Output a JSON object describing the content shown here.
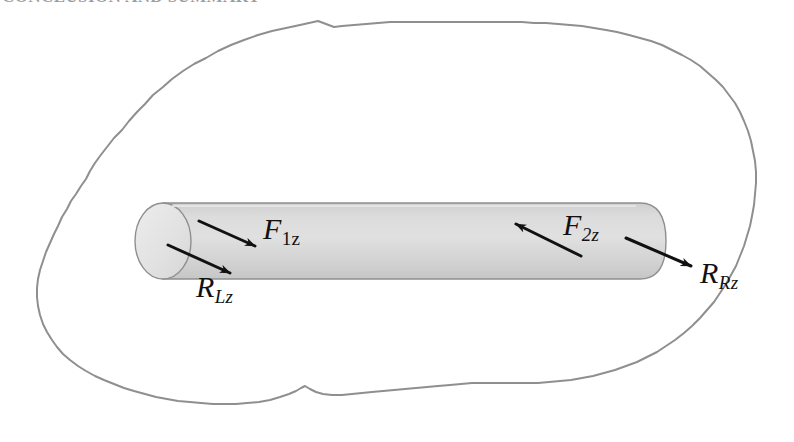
{
  "page": {
    "header_text": "CONCLUSION AND SUMMARY",
    "background_color": "#ffffff"
  },
  "figure": {
    "name": "free-body-diagram-cylinder",
    "boundary": {
      "name": "cut-boundary-blob",
      "stroke_color": "#8f8f8f",
      "fill_color": "#ffffff",
      "stroke_width": 2
    },
    "cylinder": {
      "name": "cylinder-bar",
      "body_fill": "#d7d7d7",
      "cap_fill": "#e6e6e6",
      "stroke_color": "#8f8f8f",
      "stroke_width": 1.4,
      "left_x": 136,
      "right_x": 666,
      "top_y": 203,
      "bottom_y": 279
    },
    "arrows": [
      {
        "name": "force-arrow-F1z",
        "label": "F",
        "subscript": "1z",
        "color": "#111111",
        "direction": "down-right",
        "from": [
          199,
          221
        ],
        "to": [
          261,
          249
        ]
      },
      {
        "name": "reaction-arrow-RLz",
        "label": "R",
        "subscript": "Lz",
        "color": "#111111",
        "direction": "down-right",
        "from": [
          168,
          245
        ],
        "to": [
          236,
          276
        ]
      },
      {
        "name": "force-arrow-F2z",
        "label": "F",
        "subscript": "2z",
        "color": "#111111",
        "direction": "up-left",
        "from": [
          581,
          256
        ],
        "to": [
          510,
          221
        ]
      },
      {
        "name": "reaction-arrow-RRz",
        "label": "R",
        "subscript": "Rz",
        "color": "#111111",
        "direction": "down-right",
        "from": [
          626,
          238
        ],
        "to": [
          697,
          269
        ]
      }
    ],
    "labels": {
      "F1z": {
        "base": "F",
        "sub": "1z"
      },
      "RLz": {
        "base": "R",
        "sub": "Lz"
      },
      "F2z": {
        "base": "F",
        "sub": "2z"
      },
      "RRz": {
        "base": "R",
        "sub": "Rz"
      }
    }
  }
}
